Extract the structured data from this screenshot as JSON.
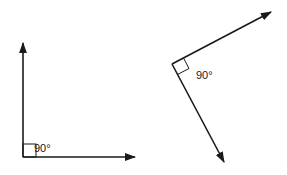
{
  "figures": [
    {
      "name": "right-angle-axis-aligned",
      "vertex": [
        23,
        157
      ],
      "ray_ends": [
        [
          23,
          42
        ],
        [
          136,
          157
        ]
      ],
      "angle_label": "90°",
      "label_pos": [
        34,
        152
      ]
    },
    {
      "name": "right-angle-rotated",
      "vertex": [
        172,
        64
      ],
      "ray_ends": [
        [
          272,
          11
        ],
        [
          225,
          163
        ]
      ],
      "angle_label": "90°",
      "label_pos": [
        196,
        79
      ]
    }
  ],
  "colors": {
    "stroke": "#1a1a1a",
    "background": "#ffffff"
  }
}
